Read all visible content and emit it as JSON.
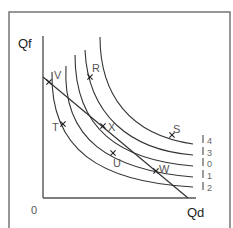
{
  "diagram": {
    "y_axis_label": "Qf",
    "x_axis_label": "Qd",
    "origin_label": "0",
    "budget_line": {
      "from": [
        43,
        77
      ],
      "to": [
        188,
        198
      ]
    },
    "points": [
      {
        "label": "V",
        "x": 49,
        "y": 82,
        "lx": 54,
        "ly": 79
      },
      {
        "label": "R",
        "x": 90,
        "y": 77,
        "lx": 92,
        "ly": 72
      },
      {
        "label": "T",
        "x": 63,
        "y": 124,
        "lx": 52,
        "ly": 131
      },
      {
        "label": "X",
        "x": 103,
        "y": 126,
        "lx": 108,
        "ly": 131
      },
      {
        "label": "U",
        "x": 113,
        "y": 153,
        "lx": 113,
        "ly": 167
      },
      {
        "label": "W",
        "x": 156,
        "y": 171,
        "lx": 159,
        "ly": 173
      },
      {
        "label": "S",
        "x": 172,
        "y": 135,
        "lx": 173,
        "ly": 133
      }
    ],
    "indifference_curves": [
      {
        "name": "I",
        "subscript": "4",
        "path": "M100 37 C100 95 130 135 193 144"
      },
      {
        "name": "I",
        "subscript": "3",
        "path": "M85 50 C88 115 130 150 193 155"
      },
      {
        "name": "I",
        "subscript": "0",
        "path": "M75 55 C75 130 120 160 193 166"
      },
      {
        "name": "I",
        "subscript": "1",
        "path": "M66 66 C62 140 110 170 193 177"
      },
      {
        "name": "I",
        "subscript": "2",
        "path": "M52 72 C50 150 100 182 193 187"
      }
    ],
    "curve_labels": [
      {
        "text": "4",
        "y": 141
      },
      {
        "text": "3",
        "y": 153
      },
      {
        "text": "0",
        "y": 164
      },
      {
        "text": "1",
        "y": 176
      },
      {
        "text": "2",
        "y": 188
      }
    ]
  }
}
